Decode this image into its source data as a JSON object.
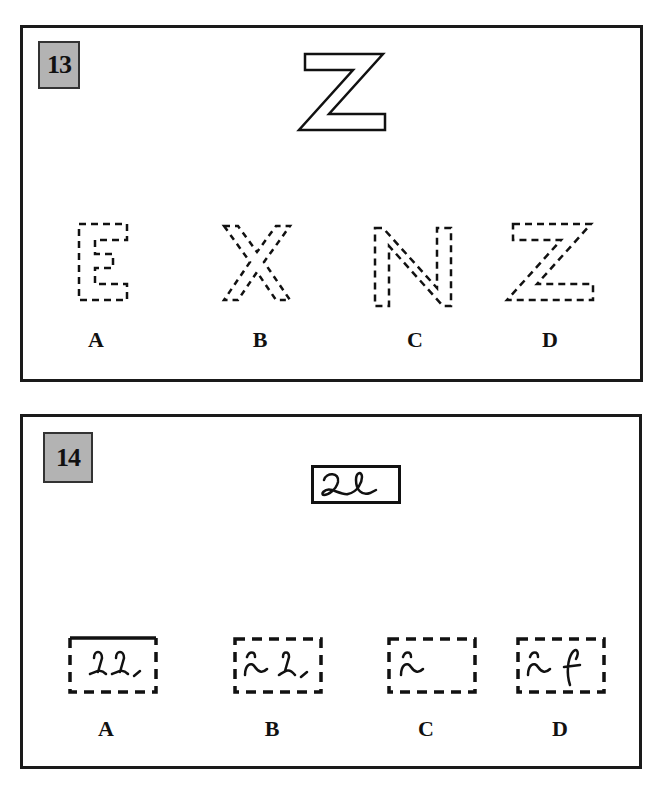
{
  "questions": [
    {
      "number": "13",
      "target": {
        "glyph": "Z",
        "style": "outlined"
      },
      "options": [
        {
          "label": "A",
          "glyph": "E",
          "style": "dashed"
        },
        {
          "label": "B",
          "glyph": "X",
          "style": "dashed"
        },
        {
          "label": "C",
          "glyph": "N",
          "style": "dashed"
        },
        {
          "label": "D",
          "glyph": "Z",
          "style": "dashed"
        }
      ]
    },
    {
      "number": "14",
      "target": {
        "glyph": "cursive-ae",
        "style": "solid-box"
      },
      "options": [
        {
          "label": "A",
          "glyph": "partial-cursive",
          "style": "dashed-box"
        },
        {
          "label": "B",
          "glyph": "partial-cursive",
          "style": "dashed-box"
        },
        {
          "label": "C",
          "glyph": "partial-cursive",
          "style": "dashed-box"
        },
        {
          "label": "D",
          "glyph": "partial-cursive",
          "style": "dashed-box"
        }
      ]
    }
  ]
}
